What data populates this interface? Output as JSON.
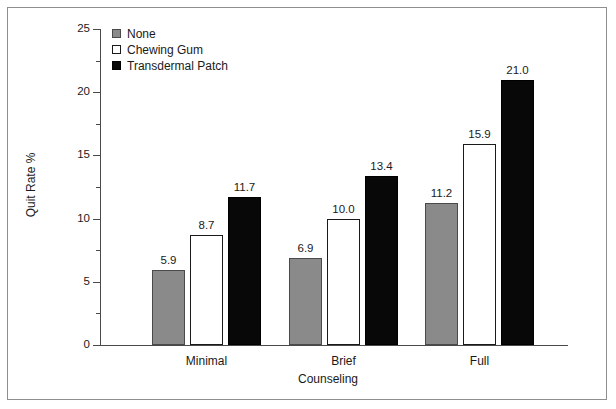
{
  "chart_data": {
    "type": "bar",
    "title": "",
    "subtitle": "",
    "xlabel": "Counseling",
    "ylabel": "Quit Rate %",
    "categories": [
      "Minimal",
      "Brief",
      "Full"
    ],
    "series": [
      {
        "name": "None",
        "color": "#8a8a8a",
        "values": [
          5.9,
          6.9,
          11.2
        ],
        "labels": [
          "5.9",
          "6.9",
          "11.2"
        ]
      },
      {
        "name": "Chewing Gum",
        "color": "#ffffff",
        "values": [
          8.7,
          10.0,
          15.9
        ],
        "labels": [
          "8.7",
          "10.0",
          "15.9"
        ]
      },
      {
        "name": "Transdermal Patch",
        "color": "#080808",
        "values": [
          11.7,
          13.4,
          21.0
        ],
        "labels": [
          "11.7",
          "13.4",
          "21.0"
        ]
      }
    ],
    "ylim": [
      0,
      25
    ],
    "ytick_labels": [
      "0",
      "5",
      "10",
      "15",
      "20",
      "25"
    ],
    "ytick_values": [
      0,
      5,
      10,
      15,
      20,
      25
    ],
    "yminor_values": [
      2.5,
      7.5,
      12.5,
      17.5,
      22.5
    ],
    "grid": false,
    "legend_position": "top-left",
    "legend_entries": [
      "None",
      "Chewing Gum",
      "Transdermal Patch"
    ],
    "data_labels_shown": true
  },
  "legend": {
    "items": [
      {
        "label": "None",
        "swatch": "gray-square-swatch"
      },
      {
        "label": "Chewing Gum",
        "swatch": "white-square-swatch"
      },
      {
        "label": "Transdermal Patch",
        "swatch": "black-square-swatch"
      }
    ]
  },
  "axes": {
    "y_title": "Quit Rate %",
    "x_title": "Counseling",
    "y_ticks": [
      "25",
      "20",
      "15",
      "10",
      "5",
      "0"
    ],
    "x_categories": [
      "Minimal",
      "Brief",
      "Full"
    ]
  },
  "colors": {
    "series_none": "#8a8a8a",
    "series_gum": "#ffffff",
    "series_patch": "#080808",
    "axis": "#4a4a4a",
    "frame": "#8f8f8f",
    "text": "#1a1a1a",
    "background": "#ffffff"
  }
}
